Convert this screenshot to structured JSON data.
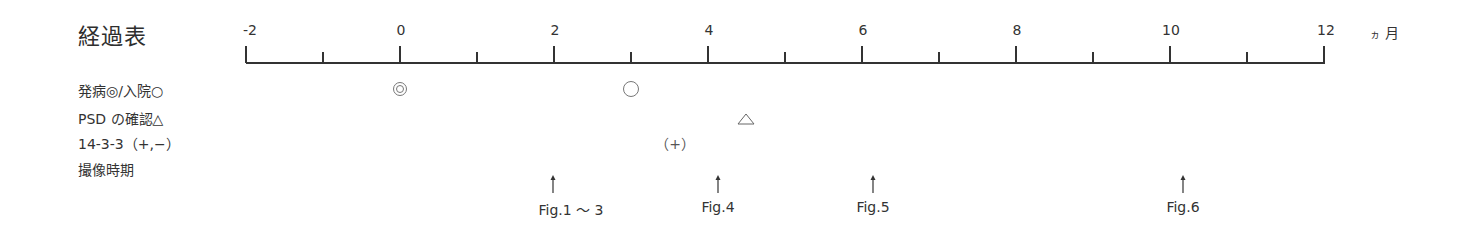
{
  "title": "経過表",
  "axis": {
    "unit": "ヵ月",
    "unit_ka": "ヵ",
    "unit_month": "月",
    "min": -2,
    "max": 12,
    "major_ticks": [
      {
        "value": -2,
        "label": "-2"
      },
      {
        "value": 0,
        "label": "0"
      },
      {
        "value": 2,
        "label": "2"
      },
      {
        "value": 4,
        "label": "4"
      },
      {
        "value": 6,
        "label": "6"
      },
      {
        "value": 8,
        "label": "8"
      },
      {
        "value": 10,
        "label": "10"
      },
      {
        "value": 12,
        "label": "12"
      }
    ],
    "minor_ticks": [
      -1,
      1,
      3,
      5,
      7,
      9,
      11
    ]
  },
  "rows": [
    {
      "label": "発病◎/入院○"
    },
    {
      "label": "PSD の確認△"
    },
    {
      "label": "14-3-3（+,−）"
    },
    {
      "label": "撮像時期"
    }
  ],
  "events": {
    "onset": {
      "symbol": "◎",
      "month": 0
    },
    "admission": {
      "symbol": "○",
      "month": 3.0
    },
    "psd_confirmed": {
      "symbol": "△",
      "month": 4.5
    },
    "protein_14_3_3": {
      "label": "（+）",
      "month": 3.55
    },
    "imaging": [
      {
        "month": 2.0,
        "label": "Fig.1 〜 3"
      },
      {
        "month": 4.1,
        "label": "Fig.4"
      },
      {
        "month": 6.1,
        "label": "Fig.5"
      },
      {
        "month": 10.2,
        "label": "Fig.6"
      }
    ]
  }
}
